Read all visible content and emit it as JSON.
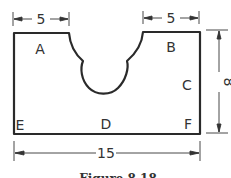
{
  "figure": {
    "caption": "Figure 8.18",
    "stroke_color": "#2a2a2a",
    "point_labels": [
      {
        "id": "A",
        "x": 40,
        "y": 53
      },
      {
        "id": "B",
        "x": 171,
        "y": 51
      },
      {
        "id": "C",
        "x": 187,
        "y": 89
      },
      {
        "id": "D",
        "x": 106,
        "y": 127
      },
      {
        "id": "E",
        "x": 19,
        "y": 130
      },
      {
        "id": "F",
        "x": 188,
        "y": 128
      }
    ],
    "dimensions": {
      "top_left_width": "5",
      "top_right_width": "5",
      "total_width": "15",
      "height": "8"
    }
  }
}
